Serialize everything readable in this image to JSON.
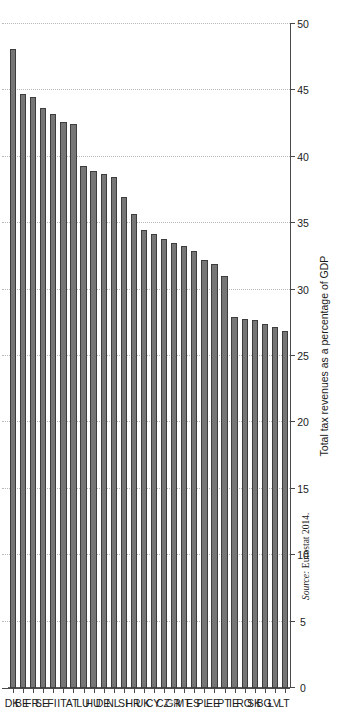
{
  "figure": {
    "source_label": "Source:",
    "source_text": "Eurostat 2014.",
    "page_number": "103"
  },
  "style": {
    "bar_fill": "#767676",
    "bar_border": "#3d3d3d",
    "grid_color": "#b9b9b9",
    "axis_color": "#4a4a4a",
    "text_color": "#1c1c1c"
  },
  "chart_data": {
    "type": "bar",
    "orientation": "horizontal",
    "title": "",
    "xlabel": "",
    "ylabel": "Total tax revenues as a percentage of GDP",
    "value_axis_label": "Total tax revenues as a percentage of GDP",
    "ylim": [
      0,
      50
    ],
    "xlim": [
      0,
      50
    ],
    "ticks": [
      0,
      5,
      10,
      15,
      20,
      25,
      30,
      35,
      40,
      45,
      50
    ],
    "tick_labels": [
      "0",
      "5",
      "10",
      "15",
      "20",
      "25",
      "30",
      "35",
      "40",
      "45",
      "50"
    ],
    "grid": true,
    "grid_axis": "value",
    "legend": false,
    "legend_position": "none",
    "categories": [
      "DK",
      "BE",
      "FR",
      "SE",
      "FI",
      "IT",
      "AT",
      "LU",
      "HU",
      "DE",
      "NL",
      "SI",
      "HR",
      "UK",
      "CY",
      "CZ",
      "GR",
      "MT",
      "ES",
      "PL",
      "EE",
      "PT",
      "IE",
      "RO",
      "SK",
      "BG",
      "LV",
      "LT"
    ],
    "category_names": [
      "Denmark",
      "Belgium",
      "France",
      "Sweden",
      "Finland",
      "Italy",
      "Austria",
      "Luxembourg",
      "Hungary",
      "Germany",
      "Netherlands",
      "Slovenia",
      "Croatia",
      "United Kingdom",
      "Cyprus",
      "Czech Republic",
      "Greece",
      "Malta",
      "Spain",
      "Poland",
      "Estonia",
      "Portugal",
      "Ireland",
      "Romania",
      "Slovakia",
      "Bulgaria",
      "Latvia",
      "Lithuania"
    ],
    "values": [
      48.1,
      44.7,
      44.5,
      43.7,
      43.2,
      42.6,
      42.5,
      39.3,
      38.9,
      38.7,
      38.5,
      37.0,
      35.7,
      34.5,
      34.2,
      33.8,
      33.5,
      33.3,
      32.9,
      32.2,
      31.9,
      31.0,
      27.9,
      27.8,
      27.7,
      27.4,
      27.2,
      26.9
    ],
    "units": "% of GDP"
  }
}
